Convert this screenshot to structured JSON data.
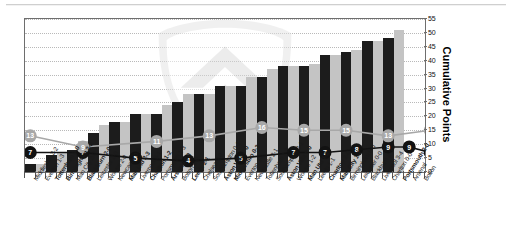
{
  "chart_data": {
    "type": "bar",
    "title": "",
    "subtitle": "",
    "xlabel": "",
    "ylabel": "Cumulative Points",
    "ylim": [
      0,
      55
    ],
    "yticks": [
      0,
      5,
      10,
      15,
      20,
      25,
      30,
      35,
      40,
      45,
      50,
      55
    ],
    "grid": true,
    "legend": "none",
    "categories": [
      "Middlesbro 3-2",
      "Everton 1-3",
      "Tottenham 3-0",
      "Birmingham 2-2",
      "Man City 2-2",
      "Blackburn 2-0",
      "Leicester 2-0",
      "Wolves 2-0",
      "Newcastle 0-0",
      "Man Utd 2-3",
      "Liverpool 3-1",
      "Charlton 1-2",
      "Portsmouth 1-3",
      "Arsenal 2-0",
      "Bolton 0-0",
      "Leeds 2-1",
      "Chelsea 2-3",
      "Southampton 0-1",
      "Aston Villa 2-0",
      "Middlesbro 0-3",
      "Everton 1-2",
      "Newcastle 2-1",
      "Tottenham 1-3",
      "Southampton 2-1",
      "Aston Villa 0-0",
      "Wolves 1-2",
      "Man Utd 1-2",
      "Leeds 1-1",
      "Charlton 2-0",
      "Man City 1-2",
      "Birmingham 0-0",
      "Leicester 0-0",
      "Blackburn 2-0",
      "Liverpool 3-4",
      "Charlton 0-0",
      "Portsmouth 2-0",
      "Arsenal",
      "Bolton"
    ],
    "categories_bold": [
      false,
      false,
      true,
      true,
      false,
      true,
      false,
      false,
      false,
      true,
      false,
      true,
      false,
      true,
      false,
      true,
      false,
      false,
      true,
      true,
      false,
      false,
      false,
      false,
      true,
      false,
      true,
      false,
      true,
      true,
      false,
      false,
      false,
      false,
      false,
      true,
      false,
      false
    ],
    "series": [
      {
        "name": "Cumulative Points",
        "type": "bar",
        "values": [
          3,
          3,
          6,
          7,
          8,
          11,
          14,
          17,
          18,
          18,
          21,
          21,
          21,
          24,
          25,
          28,
          28,
          28,
          31,
          31,
          31,
          34,
          34,
          37,
          38,
          38,
          38,
          39,
          42,
          42,
          43,
          44,
          47,
          47,
          48,
          51,
          0,
          0
        ],
        "bar_styles": [
          "home",
          "away",
          "home",
          "away",
          "home",
          "away",
          "home",
          "away",
          "home",
          "away",
          "home",
          "away",
          "home",
          "away",
          "home",
          "away",
          "home",
          "away",
          "home",
          "away",
          "home",
          "away",
          "home",
          "away",
          "home",
          "away",
          "home",
          "away",
          "home",
          "away",
          "home",
          "away",
          "home",
          "away",
          "home",
          "away",
          "none",
          "none"
        ]
      },
      {
        "name": "League Position (dark)",
        "type": "line",
        "color": "#121212",
        "points": [
          {
            "index": 1,
            "value": 7
          },
          {
            "index": 6,
            "value": 7
          },
          {
            "index": 11,
            "value": 5
          },
          {
            "index": 16,
            "value": 4
          },
          {
            "index": 21,
            "value": 5
          },
          {
            "index": 26,
            "value": 7
          },
          {
            "index": 29,
            "value": 7
          },
          {
            "index": 32,
            "value": 8
          },
          {
            "index": 35,
            "value": 9
          },
          {
            "index": 37,
            "value": 9
          },
          {
            "index": 39,
            "value": 7
          }
        ]
      },
      {
        "name": "League Position (light)",
        "type": "line",
        "color": "#a8a8a8",
        "points": [
          {
            "index": 1,
            "value": 13
          },
          {
            "index": 6,
            "value": 9
          },
          {
            "index": 13,
            "value": 11
          },
          {
            "index": 18,
            "value": 13
          },
          {
            "index": 23,
            "value": 16
          },
          {
            "index": 27,
            "value": 15
          },
          {
            "index": 31,
            "value": 15
          },
          {
            "index": 35,
            "value": 13
          },
          {
            "index": 39,
            "value": 15
          }
        ]
      }
    ]
  },
  "axis": {
    "y_right_title": "Cumulative Points"
  }
}
